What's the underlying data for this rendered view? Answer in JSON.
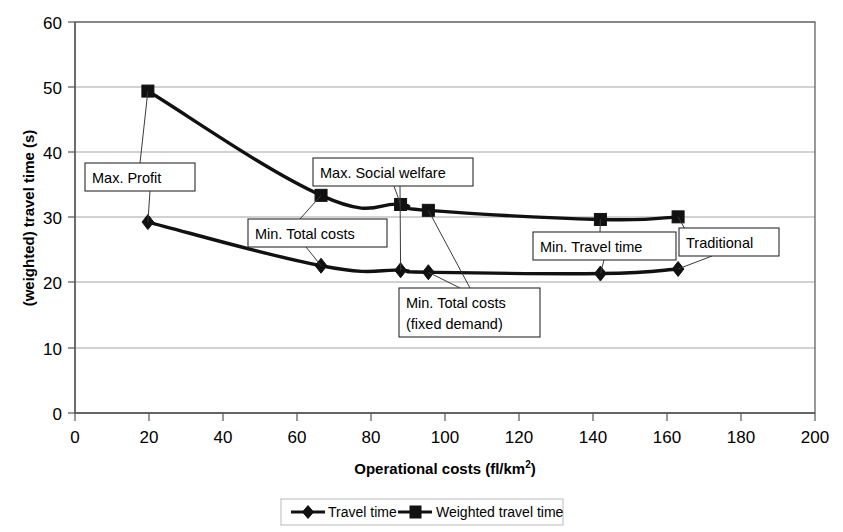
{
  "chart_data": {
    "type": "line",
    "title": "",
    "xlabel": "Operational costs (fl/km2)",
    "xlabel_base": "Operational costs (fl/km",
    "xlabel_sup": "2",
    "xlabel_tail": ")",
    "ylabel": "(weighted) travel time (s)",
    "xlim": [
      0,
      200
    ],
    "ylim": [
      0,
      60
    ],
    "xticks": [
      0,
      20,
      40,
      60,
      80,
      100,
      120,
      140,
      160,
      180,
      200
    ],
    "yticks": [
      0,
      10,
      20,
      30,
      40,
      50,
      60
    ],
    "xtick_labels": [
      "0",
      "20",
      "40",
      "60",
      "80",
      "100",
      "120",
      "140",
      "160",
      "180",
      "200"
    ],
    "ytick_labels": [
      "0",
      "10",
      "20",
      "30",
      "40",
      "50",
      "60"
    ],
    "grid": "horizontal",
    "legend_position": "bottom",
    "series": [
      {
        "name": "Travel time",
        "marker": "diamond",
        "color": "#111111",
        "points": [
          {
            "x": 19.7,
            "y": 29.3
          },
          {
            "x": 66.5,
            "y": 22.6
          },
          {
            "x": 88.0,
            "y": 21.9
          },
          {
            "x": 95.5,
            "y": 21.6
          },
          {
            "x": 142.0,
            "y": 21.4
          },
          {
            "x": 163.0,
            "y": 22.1
          }
        ]
      },
      {
        "name": "Weighted travel time",
        "marker": "square",
        "color": "#111111",
        "points": [
          {
            "x": 19.7,
            "y": 49.4
          },
          {
            "x": 66.5,
            "y": 33.4
          },
          {
            "x": 88.0,
            "y": 32.0
          },
          {
            "x": 95.5,
            "y": 31.1
          },
          {
            "x": 142.0,
            "y": 29.7
          },
          {
            "x": 163.0,
            "y": 30.1
          }
        ]
      }
    ],
    "annotations": [
      {
        "id": "max-profit",
        "label": "Max. Profit",
        "lines": [
          "Max. Profit"
        ],
        "targets": [
          "weighted@19.7",
          "travel@19.7"
        ]
      },
      {
        "id": "min-total-costs",
        "label": "Min. Total costs",
        "lines": [
          "Min. Total costs"
        ],
        "targets": [
          "weighted@66.5",
          "travel@66.5"
        ]
      },
      {
        "id": "max-social-welfare",
        "label": "Max. Social welfare",
        "lines": [
          "Max. Social welfare"
        ],
        "targets": [
          "weighted@88.0",
          "travel@88.0"
        ]
      },
      {
        "id": "min-total-costs-fixed-demand",
        "label": "Min. Total costs (fixed demand)",
        "lines": [
          "Min. Total costs",
          "(fixed demand)"
        ],
        "targets": [
          "weighted@95.5",
          "travel@95.5"
        ]
      },
      {
        "id": "min-travel-time",
        "label": "Min. Travel time",
        "lines": [
          "Min. Travel time"
        ],
        "targets": [
          "weighted@142.0",
          "travel@142.0"
        ]
      },
      {
        "id": "traditional",
        "label": "Traditional",
        "lines": [
          "Traditional"
        ],
        "targets": [
          "weighted@163.0",
          "travel@163.0"
        ]
      }
    ],
    "legend": [
      {
        "name": "Travel time",
        "marker": "diamond"
      },
      {
        "name": "Weighted travel time",
        "marker": "square"
      }
    ]
  },
  "colors": {
    "series": "#111111",
    "grid": "#9a9a9a",
    "axis": "#555555",
    "annotation_border": "#2b2b2b",
    "background": "#ffffff"
  }
}
